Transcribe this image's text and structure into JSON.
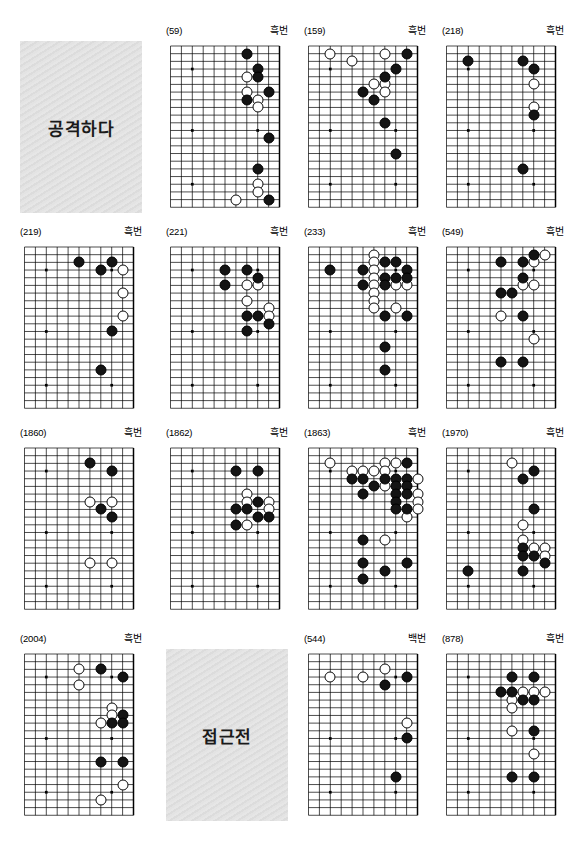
{
  "page": {
    "width": 584,
    "height": 860,
    "background": "#ffffff",
    "columns": 4,
    "rows": 4,
    "board_size": 19,
    "board_view": "right-half 11 columns x 22 rows",
    "stone_colors": {
      "black": "#141414",
      "white": "#ffffff",
      "grid": "#000000"
    }
  },
  "section_titles": [
    {
      "id": "title-attack",
      "text": "공격하다",
      "row": 1,
      "col": 1
    },
    {
      "id": "title-contact",
      "text": "접근전",
      "row": 4,
      "col": 2
    }
  ],
  "turn_labels": {
    "black": "흑번",
    "white": "백번"
  },
  "boards": [
    {
      "id": "board-59",
      "number": "(59)",
      "turn": "흑번",
      "row": 1,
      "col": 2,
      "black": [
        [
          8,
          2
        ],
        [
          9,
          4
        ],
        [
          9,
          5
        ],
        [
          10,
          7
        ],
        [
          8,
          8
        ],
        [
          10,
          13
        ],
        [
          9,
          17
        ],
        [
          10,
          21
        ]
      ],
      "white": [
        [
          8,
          5
        ],
        [
          8,
          7
        ],
        [
          9,
          8
        ],
        [
          9,
          9
        ],
        [
          9,
          19
        ],
        [
          9,
          20
        ],
        [
          7,
          21
        ]
      ]
    },
    {
      "id": "board-159",
      "number": "(159)",
      "turn": "흑번",
      "row": 1,
      "col": 3,
      "black": [
        [
          10,
          2
        ],
        [
          9,
          4
        ],
        [
          8,
          5
        ],
        [
          6,
          7
        ],
        [
          7,
          8
        ],
        [
          8,
          11
        ],
        [
          9,
          15
        ]
      ],
      "white": [
        [
          3,
          2
        ],
        [
          5,
          3
        ],
        [
          8,
          2
        ],
        [
          8,
          6
        ],
        [
          7,
          6
        ],
        [
          8,
          7
        ]
      ]
    },
    {
      "id": "board-218",
      "number": "(218)",
      "turn": "흑번",
      "row": 1,
      "col": 4,
      "black": [
        [
          3,
          3
        ],
        [
          8,
          3
        ],
        [
          9,
          4
        ],
        [
          9,
          10
        ],
        [
          8,
          17
        ]
      ],
      "white": [
        [
          9,
          6
        ],
        [
          9,
          9
        ]
      ]
    },
    {
      "id": "board-219",
      "number": "(219)",
      "turn": "흑번",
      "row": 2,
      "col": 1,
      "black": [
        [
          6,
          3
        ],
        [
          9,
          3
        ],
        [
          8,
          4
        ],
        [
          9,
          12
        ],
        [
          8,
          17
        ]
      ],
      "white": [
        [
          10,
          4
        ],
        [
          10,
          7
        ],
        [
          10,
          10
        ]
      ]
    },
    {
      "id": "board-221",
      "number": "(221)",
      "turn": "흑번",
      "row": 2,
      "col": 2,
      "black": [
        [
          6,
          4
        ],
        [
          8,
          4
        ],
        [
          9,
          5
        ],
        [
          6,
          6
        ],
        [
          8,
          10
        ],
        [
          9,
          10
        ],
        [
          10,
          11
        ],
        [
          8,
          12
        ]
      ],
      "white": [
        [
          8,
          6
        ],
        [
          9,
          6
        ],
        [
          8,
          8
        ],
        [
          10,
          9
        ],
        [
          10,
          10
        ]
      ]
    },
    {
      "id": "board-233",
      "number": "(233)",
      "turn": "흑번",
      "row": 2,
      "col": 3,
      "black": [
        [
          8,
          3
        ],
        [
          9,
          3
        ],
        [
          3,
          4
        ],
        [
          10,
          4
        ],
        [
          8,
          5
        ],
        [
          9,
          5
        ],
        [
          10,
          5
        ],
        [
          8,
          6
        ],
        [
          6,
          4
        ],
        [
          6,
          6
        ],
        [
          8,
          10
        ],
        [
          10,
          10
        ],
        [
          8,
          14
        ],
        [
          8,
          17
        ]
      ],
      "white": [
        [
          7,
          2
        ],
        [
          7,
          3
        ],
        [
          7,
          4
        ],
        [
          7,
          5
        ],
        [
          7,
          6
        ],
        [
          9,
          6
        ],
        [
          10,
          6
        ],
        [
          7,
          7
        ],
        [
          7,
          8
        ],
        [
          7,
          9
        ],
        [
          9,
          9
        ]
      ]
    },
    {
      "id": "board-549",
      "number": "(549)",
      "turn": "흑번",
      "row": 2,
      "col": 4,
      "black": [
        [
          9,
          2
        ],
        [
          6,
          3
        ],
        [
          8,
          3
        ],
        [
          8,
          5
        ],
        [
          6,
          7
        ],
        [
          7,
          7
        ],
        [
          8,
          10
        ],
        [
          6,
          16
        ],
        [
          8,
          16
        ]
      ],
      "white": [
        [
          10,
          2
        ],
        [
          9,
          3
        ],
        [
          8,
          6
        ],
        [
          9,
          6
        ],
        [
          6,
          10
        ],
        [
          9,
          13
        ]
      ]
    },
    {
      "id": "board-1860",
      "number": "(1860)",
      "turn": "흑번",
      "row": 3,
      "col": 1,
      "black": [
        [
          7,
          3
        ],
        [
          9,
          4
        ],
        [
          8,
          9
        ],
        [
          9,
          10
        ]
      ],
      "white": [
        [
          7,
          8
        ],
        [
          9,
          8
        ],
        [
          7,
          16
        ],
        [
          9,
          16
        ]
      ]
    },
    {
      "id": "board-1862",
      "number": "(1862)",
      "turn": "흑번",
      "row": 3,
      "col": 2,
      "black": [
        [
          7,
          4
        ],
        [
          9,
          4
        ],
        [
          9,
          8
        ],
        [
          7,
          9
        ],
        [
          8,
          9
        ],
        [
          9,
          10
        ],
        [
          10,
          10
        ],
        [
          7,
          11
        ]
      ],
      "white": [
        [
          8,
          7
        ],
        [
          8,
          8
        ],
        [
          10,
          8
        ],
        [
          10,
          9
        ],
        [
          8,
          11
        ]
      ]
    },
    {
      "id": "board-1863",
      "number": "(1863)",
      "turn": "흑번",
      "row": 3,
      "col": 3,
      "black": [
        [
          10,
          3
        ],
        [
          5,
          5
        ],
        [
          6,
          5
        ],
        [
          8,
          5
        ],
        [
          9,
          5
        ],
        [
          10,
          5
        ],
        [
          7,
          6
        ],
        [
          9,
          6
        ],
        [
          10,
          6
        ],
        [
          6,
          7
        ],
        [
          9,
          7
        ],
        [
          10,
          7
        ],
        [
          9,
          8
        ],
        [
          9,
          9
        ],
        [
          10,
          9
        ],
        [
          6,
          13
        ],
        [
          6,
          16
        ],
        [
          8,
          17
        ],
        [
          10,
          16
        ],
        [
          6,
          18
        ]
      ],
      "white": [
        [
          3,
          3
        ],
        [
          8,
          3
        ],
        [
          9,
          3
        ],
        [
          5,
          4
        ],
        [
          6,
          4
        ],
        [
          7,
          4
        ],
        [
          8,
          4
        ],
        [
          8,
          6
        ],
        [
          11,
          5
        ],
        [
          11,
          7
        ],
        [
          11,
          8
        ],
        [
          11,
          9
        ],
        [
          10,
          10
        ],
        [
          8,
          13
        ]
      ]
    },
    {
      "id": "board-1970",
      "number": "(1970)",
      "turn": "흑번",
      "row": 3,
      "col": 4,
      "black": [
        [
          9,
          4
        ],
        [
          8,
          5
        ],
        [
          9,
          9
        ],
        [
          8,
          14
        ],
        [
          8,
          15
        ],
        [
          9,
          15
        ],
        [
          10,
          16
        ],
        [
          8,
          17
        ],
        [
          3,
          17
        ]
      ],
      "white": [
        [
          7,
          3
        ],
        [
          8,
          11
        ],
        [
          8,
          13
        ],
        [
          9,
          14
        ],
        [
          10,
          14
        ],
        [
          10,
          15
        ]
      ]
    },
    {
      "id": "board-2004",
      "number": "(2004)",
      "turn": "흑번",
      "row": 4,
      "col": 1,
      "black": [
        [
          8,
          3
        ],
        [
          10,
          4
        ],
        [
          10,
          9
        ],
        [
          9,
          10
        ],
        [
          10,
          10
        ],
        [
          8,
          15
        ],
        [
          10,
          15
        ]
      ],
      "white": [
        [
          6,
          3
        ],
        [
          6,
          5
        ],
        [
          9,
          8
        ],
        [
          9,
          9
        ],
        [
          8,
          10
        ],
        [
          10,
          18
        ],
        [
          8,
          20
        ]
      ]
    },
    {
      "id": "board-544",
      "number": "(544)",
      "turn": "백번",
      "row": 4,
      "col": 3,
      "black": [
        [
          10,
          4
        ],
        [
          8,
          5
        ],
        [
          10,
          12
        ],
        [
          9,
          17
        ]
      ],
      "white": [
        [
          3,
          4
        ],
        [
          6,
          4
        ],
        [
          8,
          3
        ],
        [
          10,
          10
        ]
      ]
    },
    {
      "id": "board-878",
      "number": "(878)",
      "turn": "흑번",
      "row": 4,
      "col": 4,
      "black": [
        [
          7,
          4
        ],
        [
          9,
          4
        ],
        [
          6,
          6
        ],
        [
          7,
          6
        ],
        [
          8,
          7
        ],
        [
          9,
          7
        ],
        [
          7,
          17
        ],
        [
          9,
          17
        ],
        [
          9,
          11
        ]
      ],
      "white": [
        [
          8,
          6
        ],
        [
          9,
          6
        ],
        [
          10,
          6
        ],
        [
          7,
          7
        ],
        [
          7,
          8
        ],
        [
          7,
          11
        ],
        [
          9,
          14
        ]
      ]
    }
  ]
}
